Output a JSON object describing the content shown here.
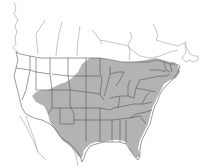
{
  "map": {
    "title": "",
    "type": "range map",
    "region": "North America (United States, southern Canada, northern Mexico)",
    "colors": {
      "background": "#ffffff",
      "land": "#ffffff",
      "range_fill": "#b3b3b3",
      "borders": "#555555"
    },
    "legend": [],
    "shaded_range": {
      "label": "range",
      "description": "Eastern and central United States extending west to the Rocky Mountain front and into southern Canada (Great Lakes region and Maritimes)"
    }
  }
}
